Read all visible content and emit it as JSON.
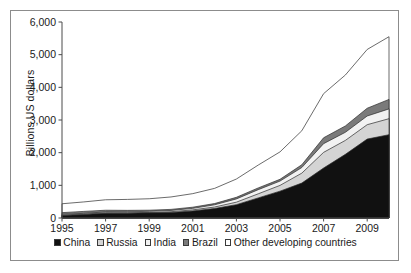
{
  "chart_data": {
    "type": "area",
    "stacked": true,
    "title": "",
    "xlabel": "",
    "ylabel": "Billions US dollars",
    "xlim": [
      1995,
      2010
    ],
    "ylim": [
      0,
      6000
    ],
    "ytick_labels": [
      "6,000",
      "5,000",
      "4,000",
      "3,000",
      "2,000",
      "1,000",
      "0"
    ],
    "ytick_values": [
      6000,
      5000,
      4000,
      3000,
      2000,
      1000,
      0
    ],
    "xtick_labels": [
      "1995",
      "1997",
      "1999",
      "2001",
      "2003",
      "2005",
      "2007",
      "2009"
    ],
    "xtick_values": [
      1995,
      1997,
      1999,
      2001,
      2003,
      2005,
      2007,
      2009
    ],
    "grid": false,
    "legend_position": "bottom",
    "x": [
      1995,
      1996,
      1997,
      1998,
      1999,
      2000,
      2001,
      2002,
      2003,
      2004,
      2005,
      2006,
      2007,
      2008,
      2009,
      2010
    ],
    "series": [
      {
        "name": "China",
        "color": "#111111",
        "values": [
          75,
          107,
          143,
          149,
          158,
          168,
          216,
          291,
          408,
          615,
          822,
          1069,
          1530,
          1949,
          2416,
          2550
        ]
      },
      {
        "name": "Russia",
        "color": "#d4d4d4",
        "values": [
          17,
          15,
          18,
          12,
          13,
          25,
          33,
          45,
          77,
          125,
          176,
          304,
          479,
          427,
          440,
          490
        ]
      },
      {
        "name": "India",
        "color": "#f2f2f2",
        "values": [
          21,
          21,
          25,
          29,
          33,
          38,
          46,
          68,
          99,
          127,
          132,
          171,
          267,
          248,
          266,
          300
        ]
      },
      {
        "name": "Brazil",
        "color": "#7a7a7a",
        "values": [
          51,
          59,
          52,
          44,
          35,
          33,
          36,
          38,
          49,
          53,
          54,
          86,
          180,
          194,
          238,
          290
        ]
      },
      {
        "name": "Other developing countries",
        "color": "#ffffff",
        "values": [
          272,
          290,
          320,
          335,
          350,
          380,
          415,
          465,
          560,
          700,
          840,
          1040,
          1350,
          1560,
          1800,
          1920
        ]
      }
    ],
    "totals": [
      436,
      492,
      558,
      569,
      589,
      644,
      746,
      907,
      1193,
      1620,
      2024,
      2670,
      3806,
      4378,
      5160,
      5550
    ]
  },
  "legend": {
    "items": [
      {
        "label": "China",
        "color": "#111111"
      },
      {
        "label": "Russia",
        "color": "#d4d4d4"
      },
      {
        "label": "India",
        "color": "#f2f2f2"
      },
      {
        "label": "Brazil",
        "color": "#7a7a7a"
      },
      {
        "label": "Other developing countries",
        "color": "#ffffff"
      }
    ]
  }
}
